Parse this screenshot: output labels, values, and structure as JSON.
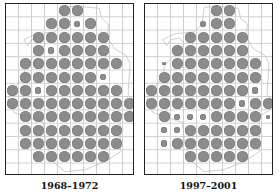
{
  "figure": {
    "panels": [
      {
        "id": "left",
        "label": "1968–1972",
        "rows": [
          "....LL....",
          "...LLsL...",
          "..LLLLLL..",
          "..LsLLLL..",
          ".LLLLLLLL.",
          ".LLLLLLs..",
          "LLsLLLLLL.",
          "LLLLLLLLLL",
          ".LLLLLLLLL",
          ".LLLLLLLL.",
          ".LLLLLLLL.",
          "..LLLLLL.."
        ]
      },
      {
        "id": "right",
        "label": "1997–2001",
        "rows": [
          ".....LL...",
          "....sLL...",
          "...LLLLL..",
          "..LLLLLL..",
          ".tLLLLLLL.",
          ".LLLLLLLL.",
          "LLLLLLLLs.",
          "LLLLLLLsLL",
          ".LsssLLLLt",
          ".ssLLLLLL.",
          ".sLLLLLLL.",
          "...LLLLL.."
        ]
      }
    ],
    "legend_key": {
      "L": "large dot",
      "s": "small dot",
      "t": "tiny dot",
      ".": "no dot"
    },
    "dot_color": "#8c8c8c",
    "grid_color": "#cfcfcf"
  }
}
